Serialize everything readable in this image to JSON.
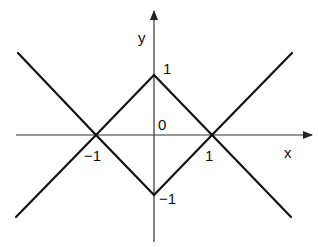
{
  "figure": {
    "axes": {
      "x_label": "x",
      "y_label": "y",
      "origin_label": "0"
    },
    "tick_labels": {
      "x_pos": "1",
      "x_neg": "−1",
      "y_pos": "1",
      "y_neg": "−1"
    },
    "lines": [
      {
        "equation": "y = -x - 1",
        "from": [
          -2.4,
          1.4
        ],
        "to": [
          0,
          -1
        ]
      },
      {
        "equation": "y = x + 1",
        "from": [
          -2.4,
          -1.4
        ],
        "to": [
          0,
          1
        ]
      },
      {
        "equation": "y = -x + 1",
        "from": [
          0,
          1
        ],
        "to": [
          2.4,
          -1.4
        ]
      },
      {
        "equation": "y = x - 1",
        "from": [
          0,
          -1
        ],
        "to": [
          2.4,
          1.4
        ]
      }
    ],
    "colors": {
      "line": "#111111",
      "axis": "#333333",
      "background": "#ffffff"
    }
  }
}
